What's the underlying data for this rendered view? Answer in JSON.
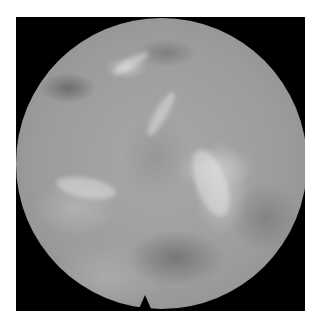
{
  "image": {
    "description": "Circular grayscale endoscopic/fluoroscopic view on black square background with white border",
    "colors": {
      "background": "#ffffff",
      "frame": "#000000",
      "tissue_base": "#a0a0a0"
    }
  }
}
